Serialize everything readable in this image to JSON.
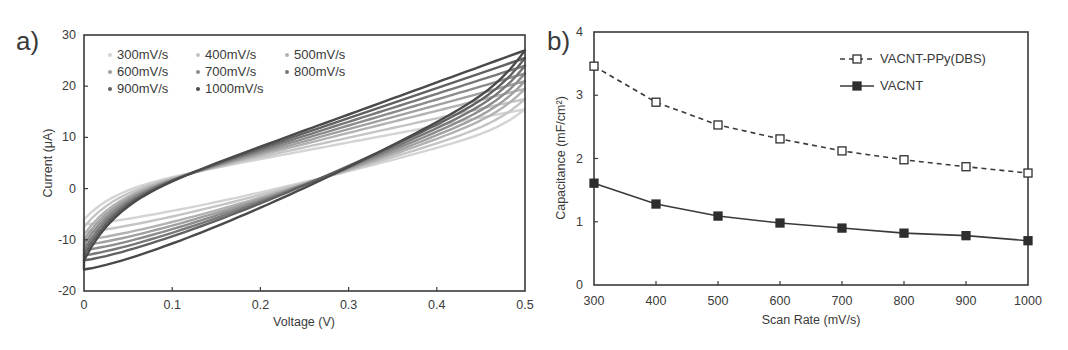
{
  "chart_data": [
    {
      "panel": "a)",
      "type": "line",
      "title": "",
      "xlabel": "Voltage (V)",
      "ylabel": "Current (μA)",
      "xlim": [
        0,
        0.5
      ],
      "ylim": [
        -20,
        30
      ],
      "xticks": [
        "0",
        "0.1",
        "0.2",
        "0.3",
        "0.4",
        "0.5"
      ],
      "yticks": [
        "-20",
        "-10",
        "0",
        "10",
        "20",
        "30"
      ],
      "grid": false,
      "legend_position": "upper-left, 3 columns",
      "series": [
        {
          "name": "300mV/s",
          "color": "#d4d4d4",
          "start": -6,
          "upper_mid": 9,
          "end": 15.5,
          "lower_mid": 0.5,
          "low_start": -7
        },
        {
          "name": "400mV/s",
          "color": "#c4c4c4",
          "start": -7.5,
          "upper_mid": 9.8,
          "end": 17.5,
          "lower_mid": 0,
          "low_start": -8.5
        },
        {
          "name": "500mV/s",
          "color": "#b2b2b2",
          "start": -9,
          "upper_mid": 10.5,
          "end": 19.5,
          "lower_mid": -0.5,
          "low_start": -10
        },
        {
          "name": "600mV/s",
          "color": "#a0a0a0",
          "start": -10,
          "upper_mid": 11.2,
          "end": 21,
          "lower_mid": -1,
          "low_start": -11
        },
        {
          "name": "700mV/s",
          "color": "#8c8c8c",
          "start": -11,
          "upper_mid": 11.8,
          "end": 22.5,
          "lower_mid": -1.6,
          "low_start": -12
        },
        {
          "name": "800mV/s",
          "color": "#787878",
          "start": -12,
          "upper_mid": 12.4,
          "end": 24,
          "lower_mid": -2.2,
          "low_start": -13
        },
        {
          "name": "900mV/s",
          "color": "#616161",
          "start": -13,
          "upper_mid": 13,
          "end": 25.5,
          "lower_mid": -2.8,
          "low_start": -14
        },
        {
          "name": "1000mV/s",
          "color": "#4a4a4a",
          "start": -14,
          "upper_mid": 13.6,
          "end": 27,
          "lower_mid": -3.4,
          "low_start": -15.8
        }
      ]
    },
    {
      "panel": "b)",
      "type": "line",
      "title": "",
      "xlabel": "Scan Rate (mV/s)",
      "ylabel": "Capacitance (mF/cm²)",
      "xlim": [
        300,
        1000
      ],
      "ylim": [
        0,
        4
      ],
      "x": [
        300,
        400,
        500,
        600,
        700,
        800,
        900,
        1000
      ],
      "xticks": [
        "300",
        "400",
        "500",
        "600",
        "700",
        "800",
        "900",
        "1000"
      ],
      "yticks": [
        "0",
        "1",
        "2",
        "3",
        "4"
      ],
      "grid": false,
      "legend_position": "upper-right",
      "series": [
        {
          "name": "VACNT-PPy(DBS)",
          "marker": "open-square",
          "line": "dashed",
          "values": [
            3.46,
            2.89,
            2.53,
            2.31,
            2.12,
            1.98,
            1.87,
            1.77
          ]
        },
        {
          "name": "VACNT",
          "marker": "filled-square",
          "line": "solid",
          "values": [
            1.61,
            1.28,
            1.09,
            0.98,
            0.9,
            0.82,
            0.78,
            0.7
          ]
        }
      ]
    }
  ]
}
